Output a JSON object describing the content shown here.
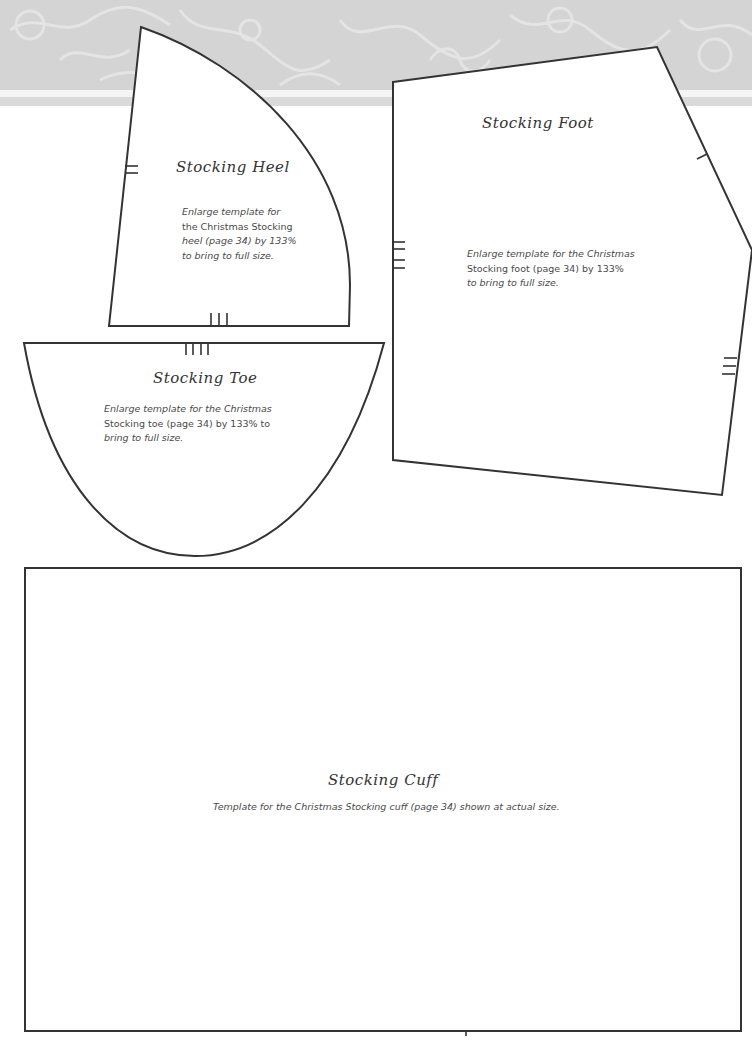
{
  "page": {
    "header_band": {
      "color": "#d4d4d4",
      "stripe_color": "#f4f4f4"
    },
    "outline_color": "#333333"
  },
  "templates": {
    "heel": {
      "title": "Stocking Heel",
      "lines": [
        "Enlarge template for",
        "the Christmas Stocking",
        "heel (page 34) by 133%",
        "to bring to full size."
      ],
      "notches": {
        "side": 2,
        "bottom": 3
      }
    },
    "toe": {
      "title": "Stocking Toe",
      "lines": [
        "Enlarge template for the Christmas",
        "Stocking toe (page 34) by 133% to",
        "bring to full size."
      ],
      "notches": {
        "top": 4
      }
    },
    "foot": {
      "title": "Stocking Foot",
      "lines": [
        "Enlarge template for the Christmas",
        "Stocking foot (page 34) by 133%",
        "to bring to full size."
      ],
      "notches": {
        "left": 4,
        "upper_right": 1,
        "lower_right": 3
      }
    },
    "cuff": {
      "title": "Stocking Cuff",
      "lines": [
        "Template for the Christmas Stocking cuff (page 34) shown at actual size."
      ]
    }
  }
}
